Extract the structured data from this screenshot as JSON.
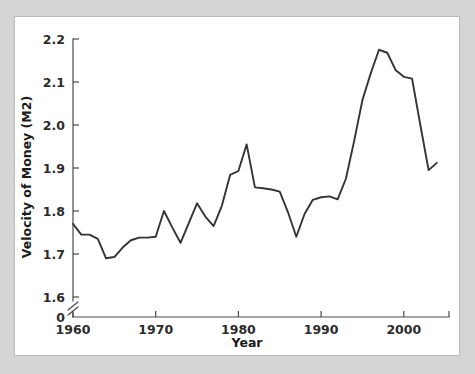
{
  "figure": {
    "background_color": "#d4d4d4",
    "panel_color": "#ffffff",
    "panel_border_color": "#b9b9b9"
  },
  "chart_data": {
    "type": "line",
    "title": "",
    "xlabel": "Year",
    "ylabel": "Velocity of Money (M2)",
    "xlim": [
      1960,
      2004.5
    ],
    "ylim": [
      1.6,
      2.2
    ],
    "ytick_labels": [
      "2.2",
      "2.1",
      "2.0",
      "1.9",
      "1.8",
      "1.7",
      "1.6",
      "0"
    ],
    "ytick_values": [
      2.2,
      2.1,
      2.0,
      1.9,
      1.8,
      1.7,
      1.6
    ],
    "yzero_label": "0",
    "xtick_labels": [
      "1960",
      "1970",
      "1980",
      "1990",
      "2000"
    ],
    "xtick_values": [
      1960,
      1970,
      1980,
      1990,
      2000
    ],
    "grid": false,
    "legend": false,
    "axis_break": true,
    "line_color": "#343434",
    "series": [
      {
        "name": "Velocity of Money (M2)",
        "x": [
          1960,
          1961,
          1962,
          1963,
          1964,
          1965,
          1966,
          1967,
          1968,
          1969,
          1970,
          1971,
          1972,
          1973,
          1974,
          1975,
          1976,
          1977,
          1978,
          1979,
          1980,
          1981,
          1982,
          1983,
          1984,
          1985,
          1986,
          1987,
          1988,
          1989,
          1990,
          1991,
          1992,
          1993,
          1994,
          1995,
          1996,
          1997,
          1998,
          1999,
          2000,
          2001,
          2002,
          2003,
          2004
        ],
        "values": [
          1.77,
          1.745,
          1.745,
          1.735,
          1.69,
          1.693,
          1.715,
          1.732,
          1.738,
          1.738,
          1.74,
          1.8,
          1.762,
          1.726,
          1.772,
          1.818,
          1.787,
          1.765,
          1.812,
          1.884,
          1.893,
          1.955,
          1.855,
          1.853,
          1.85,
          1.845,
          1.797,
          1.74,
          1.793,
          1.826,
          1.832,
          1.834,
          1.827,
          1.875,
          1.963,
          2.058,
          2.12,
          2.175,
          2.168,
          2.128,
          2.112,
          2.108,
          2.0,
          1.895,
          1.912
        ]
      }
    ]
  },
  "axis": {
    "x_title": "Year",
    "y_title": "Velocity of Money (M2)"
  }
}
